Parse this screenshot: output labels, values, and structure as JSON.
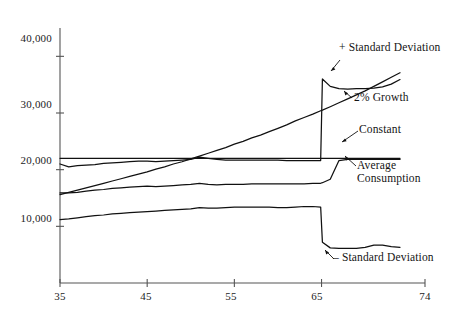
{
  "chart_data": {
    "type": "line",
    "title": "",
    "xlabel": "",
    "ylabel": "",
    "xlim": [
      35,
      74
    ],
    "ylim": [
      0,
      45000
    ],
    "grid": false,
    "legend_position": "inline-annotations",
    "x_ticks": [
      "35",
      "45",
      "55",
      "65",
      "74"
    ],
    "x_tick_values": [
      35,
      45,
      55,
      65,
      74
    ],
    "y_ticks": [
      "10,000",
      "20,000",
      "30,000",
      "40,000"
    ],
    "y_tick_values": [
      10000,
      20000,
      30000,
      40000
    ],
    "x": [
      35,
      36,
      37,
      38,
      39,
      40,
      41,
      42,
      43,
      44,
      45,
      46,
      47,
      48,
      49,
      50,
      51,
      52,
      53,
      54,
      55,
      56,
      57,
      58,
      59,
      60,
      61,
      62,
      63,
      64,
      64.9,
      65.1,
      66,
      67,
      68,
      69,
      70,
      71,
      72,
      73,
      74
    ],
    "series": [
      {
        "name": "+ Standard Deviation",
        "label": "+ Standard Deviation",
        "values": [
          21000,
          20500,
          20700,
          20800,
          20900,
          21100,
          21200,
          21300,
          21400,
          21500,
          21500,
          21400,
          21500,
          21600,
          21700,
          21800,
          22200,
          22000,
          21800,
          21700,
          21700,
          21700,
          21700,
          21700,
          21700,
          21700,
          21600,
          21600,
          21600,
          21600,
          21600,
          36000,
          34700,
          34300,
          34200,
          34300,
          34300,
          34400,
          34600,
          35100,
          35900
        ]
      },
      {
        "name": "2% Growth",
        "label": "2% Growth",
        "values": [
          15600,
          16000,
          16400,
          16800,
          17200,
          17600,
          18000,
          18400,
          18800,
          19200,
          19600,
          20100,
          20500,
          21000,
          21400,
          21900,
          22400,
          22900,
          23400,
          23900,
          24500,
          25000,
          25600,
          26100,
          26700,
          27300,
          27900,
          28600,
          29200,
          29800,
          30400,
          30500,
          31100,
          31800,
          32500,
          33200,
          33900,
          34700,
          35500,
          36300,
          37100
        ]
      },
      {
        "name": "Constant",
        "label": "Constant",
        "values": [
          22000,
          22000,
          22000,
          22000,
          22000,
          22000,
          22000,
          22000,
          22000,
          22000,
          22000,
          22000,
          22000,
          22000,
          22000,
          22000,
          22000,
          22000,
          22000,
          22000,
          22000,
          22000,
          22000,
          22000,
          22000,
          22000,
          22000,
          22000,
          22000,
          22000,
          22000,
          22000,
          22000,
          22000,
          22000,
          22000,
          22000,
          22000,
          22000,
          22000,
          22000
        ]
      },
      {
        "name": "Average Consumption",
        "label": "Average\nConsumption",
        "values": [
          15900,
          15900,
          16000,
          16200,
          16400,
          16500,
          16700,
          16800,
          16900,
          17000,
          17100,
          17000,
          17100,
          17200,
          17300,
          17400,
          17600,
          17400,
          17300,
          17400,
          17400,
          17400,
          17500,
          17500,
          17500,
          17500,
          17500,
          17500,
          17500,
          17600,
          17600,
          17700,
          18300,
          21600,
          21800,
          21800,
          21800,
          21800,
          21800,
          21800,
          21800
        ]
      },
      {
        "name": "- Standard Deviation",
        "label": "- Standard Deviation",
        "values": [
          11200,
          11300,
          11500,
          11700,
          11900,
          12000,
          12200,
          12300,
          12400,
          12500,
          12600,
          12700,
          12800,
          12900,
          13000,
          13100,
          13300,
          13200,
          13200,
          13300,
          13400,
          13400,
          13400,
          13400,
          13400,
          13300,
          13300,
          13400,
          13500,
          13500,
          13400,
          7200,
          6200,
          6100,
          6100,
          6100,
          6300,
          6700,
          6700,
          6400,
          6300
        ]
      }
    ]
  },
  "annotations": {
    "plus_sd": "+ Standard Deviation",
    "growth": "2% Growth",
    "constant": "Constant",
    "average": "Average\nConsumption",
    "minus_sd": "– Standard Deviation"
  },
  "axes": {
    "y_labels": [
      "40,000",
      "30,000",
      "20,000",
      "10,000"
    ],
    "x_labels": [
      "35",
      "45",
      "55",
      "65",
      "74"
    ]
  },
  "colors": {
    "line": "#111111",
    "axis": "#4a4a4a",
    "background": "#ffffff"
  }
}
